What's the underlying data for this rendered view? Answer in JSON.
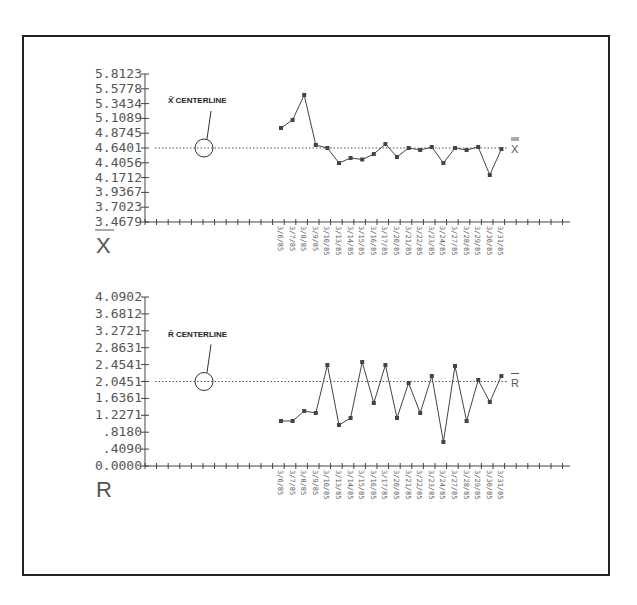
{
  "chart_data": [
    {
      "type": "line",
      "title": "X-bar chart",
      "ylabel_symbol": "X̄",
      "yticks": [
        "5.8123",
        "5.5778",
        "5.3434",
        "5.1089",
        "4.8745",
        "4.6401",
        "4.4056",
        "4.1712",
        "3.9367",
        "3.7023",
        "3.4679"
      ],
      "ylim": [
        3.4679,
        5.8123
      ],
      "centerline": 4.6401,
      "centerline_label": "X̄̄ CENTERLINE",
      "centerline_end_label": "X̄̄",
      "grid": false,
      "categories": [
        "6",
        "7",
        "8",
        "9",
        "10",
        "13",
        "14",
        "15",
        "16",
        "17",
        "20",
        "21",
        "22",
        "23",
        "24",
        "27",
        "28",
        "29",
        "30",
        "31"
      ],
      "values": [
        4.957,
        5.084,
        5.48,
        4.688,
        4.64,
        4.402,
        4.482,
        4.458,
        4.545,
        4.703,
        4.498,
        4.64,
        4.608,
        4.656,
        4.402,
        4.64,
        4.608,
        4.656,
        4.212,
        4.624
      ]
    },
    {
      "type": "line",
      "title": "R chart",
      "ylabel_symbol": "R",
      "yticks": [
        "4.0902",
        "3.6812",
        "3.2721",
        "2.8631",
        "2.4541",
        "2.0451",
        "1.6361",
        "1.2271",
        ".8180",
        ".4090",
        "0.0000"
      ],
      "ylim": [
        0.0,
        4.0902
      ],
      "centerline": 2.0451,
      "centerline_label": "R̄ CENTERLINE",
      "centerline_end_label": "R̄",
      "grid": false,
      "categories": [
        "6",
        "7",
        "8",
        "9",
        "10",
        "13",
        "14",
        "15",
        "16",
        "17",
        "20",
        "21",
        "22",
        "23",
        "24",
        "27",
        "28",
        "29",
        "30",
        "31"
      ],
      "values": [
        1.089,
        1.089,
        1.331,
        1.283,
        2.444,
        0.992,
        1.162,
        2.517,
        1.525,
        2.444,
        1.162,
        2.009,
        1.283,
        2.178,
        0.581,
        2.42,
        1.089,
        2.081,
        1.549,
        2.178
      ]
    }
  ],
  "labels": {
    "xbar_callout": "X̄̄ CENTERLINE",
    "r_callout": "R̄ CENTERLINE",
    "xbar_symbol": "X",
    "r_symbol": "R",
    "xbar_end": "X",
    "r_end": "R"
  },
  "date_prefix": "3/2/85"
}
